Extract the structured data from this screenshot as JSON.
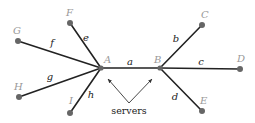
{
  "diagram": {
    "type": "network-tree",
    "nodes": [
      {
        "id": "A",
        "label": "A",
        "x": 101,
        "y": 68,
        "lx": 104,
        "ly": 63
      },
      {
        "id": "B",
        "label": "B",
        "x": 160,
        "y": 68,
        "lx": 154,
        "ly": 63
      },
      {
        "id": "C",
        "label": "C",
        "x": 202,
        "y": 25,
        "lx": 201,
        "ly": 18
      },
      {
        "id": "D",
        "label": "D",
        "x": 240,
        "y": 69,
        "lx": 237,
        "ly": 62
      },
      {
        "id": "E",
        "label": "E",
        "x": 202,
        "y": 111,
        "lx": 200,
        "ly": 104
      },
      {
        "id": "F",
        "label": "F",
        "x": 70,
        "y": 23,
        "lx": 66,
        "ly": 16
      },
      {
        "id": "G",
        "label": "G",
        "x": 18,
        "y": 41,
        "lx": 13,
        "ly": 34
      },
      {
        "id": "H",
        "label": "H",
        "x": 19,
        "y": 97,
        "lx": 14,
        "ly": 90
      },
      {
        "id": "I",
        "label": "I",
        "x": 70,
        "y": 113,
        "lx": 69,
        "ly": 104
      }
    ],
    "edges": [
      {
        "id": "a",
        "label": "a",
        "from": "A",
        "to": "B",
        "lx": 130,
        "ly": 65
      },
      {
        "id": "b",
        "label": "b",
        "from": "B",
        "to": "C",
        "lx": 176,
        "ly": 42
      },
      {
        "id": "c",
        "label": "c",
        "from": "B",
        "to": "D",
        "lx": 201,
        "ly": 65
      },
      {
        "id": "d",
        "label": "d",
        "from": "B",
        "to": "E",
        "lx": 175,
        "ly": 100
      },
      {
        "id": "e",
        "label": "e",
        "from": "A",
        "to": "F",
        "lx": 86,
        "ly": 41
      },
      {
        "id": "f",
        "label": "f",
        "from": "A",
        "to": "G",
        "lx": 52,
        "ly": 46
      },
      {
        "id": "g",
        "label": "g",
        "from": "A",
        "to": "H",
        "lx": 50,
        "ly": 80
      },
      {
        "id": "h",
        "label": "h",
        "from": "A",
        "to": "I",
        "lx": 91,
        "ly": 98
      }
    ],
    "annotation": {
      "text": "servers",
      "text_x": 129,
      "text_y": 114,
      "origin": {
        "x": 129,
        "y": 103
      },
      "targets": [
        {
          "node": "A",
          "x": 108,
          "y": 79
        },
        {
          "node": "B",
          "x": 152,
          "y": 79
        }
      ]
    }
  }
}
